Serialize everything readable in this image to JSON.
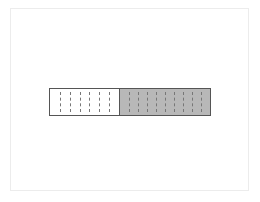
{
  "diagram": {
    "type": "fraction-bar",
    "colors": {
      "filled": "#b8b8b8",
      "empty": "#ffffff",
      "border": "#555555",
      "divider": "#777777",
      "frame": "#ececec"
    },
    "segments": [
      {
        "name": "unshaded",
        "fill": "#ffffff",
        "width_px": 70,
        "divider_count": 6
      },
      {
        "name": "shaded",
        "fill": "#b8b8b8",
        "width_px": 90,
        "divider_count": 9
      }
    ]
  }
}
